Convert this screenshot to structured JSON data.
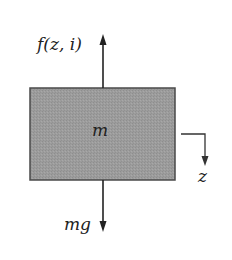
{
  "diagram": {
    "type": "free-body-diagram",
    "body": {
      "label": "m",
      "fill": "#9a9a9a",
      "stroke": "#444444"
    },
    "forces": [
      {
        "id": "upward",
        "label": "f(z, i)",
        "direction": "up"
      },
      {
        "id": "downward",
        "label": "mg",
        "direction": "down"
      }
    ],
    "axis": {
      "label": "z",
      "direction": "down"
    }
  }
}
